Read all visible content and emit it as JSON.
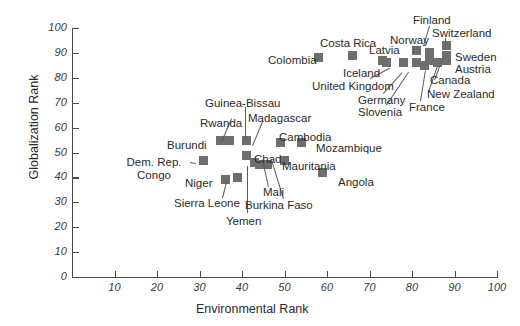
{
  "chart_data": {
    "type": "scatter",
    "title": "",
    "xlabel": "Environmental Rank",
    "ylabel": "Globalization Rank",
    "xlim": [
      0,
      100
    ],
    "ylim": [
      0,
      100
    ],
    "xticks": [
      10,
      20,
      30,
      40,
      50,
      60,
      70,
      80,
      90,
      100
    ],
    "yticks": [
      0,
      10,
      20,
      30,
      40,
      50,
      60,
      70,
      80,
      90,
      100
    ],
    "grid": false,
    "legend": "none",
    "marker": "square",
    "marker_color": "#6e6e6e",
    "points": [
      {
        "label": "Dem. Rep. Congo",
        "x": 31,
        "y": 47
      },
      {
        "label": "Burundi",
        "x": 35,
        "y": 55
      },
      {
        "label": "Rwanda",
        "x": 37,
        "y": 55
      },
      {
        "label": "Niger",
        "x": 36,
        "y": 39
      },
      {
        "label": "Sierra Leone",
        "x": 39,
        "y": 40
      },
      {
        "label": "Yemen",
        "x": 41,
        "y": 49
      },
      {
        "label": "Guinea-Bissau",
        "x": 41,
        "y": 55
      },
      {
        "label": "Chad",
        "x": 41,
        "y": 49
      },
      {
        "label": "Madagascar",
        "x": 43,
        "y": 46
      },
      {
        "label": "Mali",
        "x": 44,
        "y": 45
      },
      {
        "label": "Burkina Faso",
        "x": 46,
        "y": 45
      },
      {
        "label": "Cambodia",
        "x": 49,
        "y": 54
      },
      {
        "label": "Mauritania",
        "x": 50,
        "y": 47
      },
      {
        "label": "Mozambique",
        "x": 54,
        "y": 54
      },
      {
        "label": "Angola",
        "x": 59,
        "y": 42
      },
      {
        "label": "Colombia",
        "x": 58,
        "y": 88
      },
      {
        "label": "Costa Rica",
        "x": 66,
        "y": 89
      },
      {
        "label": "Iceland",
        "x": 73,
        "y": 87
      },
      {
        "label": "Latvia",
        "x": 74,
        "y": 86
      },
      {
        "label": "United Kingdom",
        "x": 78,
        "y": 86
      },
      {
        "label": "Germany",
        "x": 81,
        "y": 86
      },
      {
        "label": "Slovenia",
        "x": 81,
        "y": 86
      },
      {
        "label": "Norway",
        "x": 81,
        "y": 91
      },
      {
        "label": "France",
        "x": 83,
        "y": 85
      },
      {
        "label": "Finland",
        "x": 84,
        "y": 90
      },
      {
        "label": "New Zealand",
        "x": 84,
        "y": 87
      },
      {
        "label": "Canada",
        "x": 86,
        "y": 86
      },
      {
        "label": "Switzerland",
        "x": 88,
        "y": 93
      },
      {
        "label": "Sweden",
        "x": 88,
        "y": 89
      },
      {
        "label": "Austria",
        "x": 88,
        "y": 87
      }
    ]
  },
  "axes": {
    "y_title": "Globalization Rank",
    "x_title": "Environmental Rank",
    "y_labels": [
      "100",
      "90",
      "80",
      "70",
      "60",
      "50",
      "40",
      "30",
      "20",
      "10",
      "0"
    ],
    "x_labels": [
      "10",
      "20",
      "30",
      "40",
      "50",
      "60",
      "70",
      "80",
      "90",
      "100"
    ]
  },
  "labels": {
    "dem_rep_congo_l1": "Dem. Rep.",
    "dem_rep_congo_l2": "Congo",
    "burundi": "Burundi",
    "rwanda": "Rwanda",
    "niger": "Niger",
    "sierra_leone": "Sierra Leone",
    "yemen": "Yemen",
    "guinea_bissau": "Guinea-Bissau",
    "chad": "Chad",
    "madagascar": "Madagascar",
    "mali": "Mali",
    "burkina_faso": "Burkina Faso",
    "cambodia": "Cambodia",
    "mauritania": "Mauritania",
    "mozambique": "Mozambique",
    "angola": "Angola",
    "colombia": "Colombia",
    "costa_rica": "Costa Rica",
    "iceland": "Iceland",
    "latvia": "Latvia",
    "united_kingdom": "United Kingdom",
    "germany": "Germany",
    "slovenia": "Slovenia",
    "norway": "Norway",
    "france": "France",
    "finland": "Finland",
    "new_zealand": "New Zealand",
    "canada": "Canada",
    "switzerland": "Switzerland",
    "sweden": "Sweden",
    "austria": "Austria"
  }
}
